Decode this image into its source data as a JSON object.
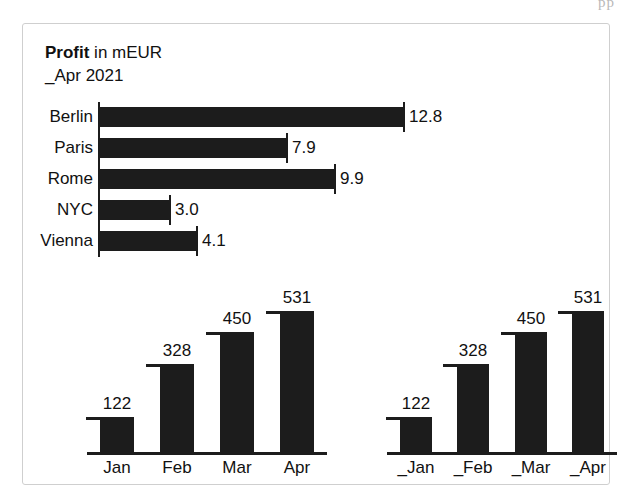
{
  "page": {
    "top_artifact_text": "pp",
    "background_color": "#ffffff",
    "frame_border_color": "#cfcfcf",
    "ink_color": "#1c1c1c"
  },
  "heading": {
    "strong_word": "Profit",
    "rest": " in mEUR",
    "subtitle": "_Apr 2021"
  },
  "chart_data": [
    {
      "id": "profit-by-city",
      "type": "bar",
      "orientation": "horizontal",
      "title": "Profit in mEUR",
      "subtitle": "_Apr 2021",
      "xlabel": "",
      "ylabel": "",
      "unit": "mEUR",
      "grid": false,
      "legend": false,
      "xlim": [
        0,
        12.8
      ],
      "categories": [
        "Berlin",
        "Paris",
        "Rome",
        "NYC",
        "Vienna"
      ],
      "values": [
        12.8,
        7.9,
        9.9,
        3.0,
        4.1
      ],
      "value_labels": [
        "12.8",
        "7.9",
        "9.9",
        "3.0",
        "4.1"
      ]
    },
    {
      "id": "monthly-left",
      "type": "bar",
      "orientation": "vertical",
      "title": "",
      "xlabel": "",
      "ylabel": "",
      "grid": false,
      "legend": false,
      "ylim": [
        0,
        531
      ],
      "categories": [
        "Jan",
        "Feb",
        "Mar",
        "Apr"
      ],
      "values": [
        122,
        328,
        450,
        531
      ],
      "value_labels": [
        "122",
        "328",
        "450",
        "531"
      ]
    },
    {
      "id": "monthly-right",
      "type": "bar",
      "orientation": "vertical",
      "title": "",
      "xlabel": "",
      "ylabel": "",
      "grid": false,
      "legend": false,
      "ylim": [
        0,
        531
      ],
      "categories": [
        "_Jan",
        "_Feb",
        "_Mar",
        "_Apr"
      ],
      "values": [
        122,
        328,
        450,
        531
      ],
      "value_labels": [
        "122",
        "328",
        "450",
        "531"
      ]
    }
  ]
}
